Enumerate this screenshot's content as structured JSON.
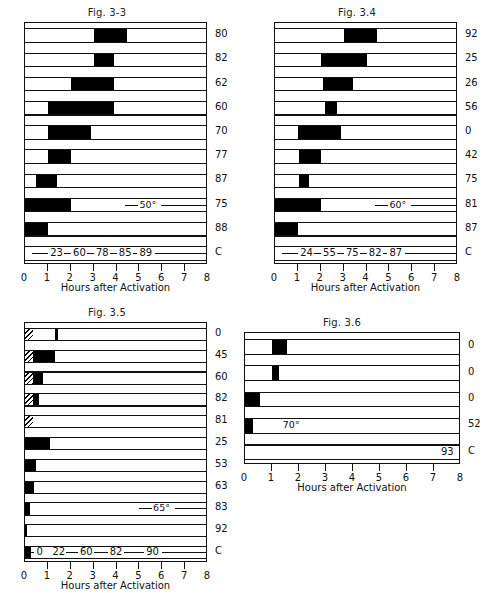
{
  "page": {
    "background": "#ffffff",
    "ink": "#000000"
  },
  "axis": {
    "title": "Hours after Activation",
    "ticks": [
      "0",
      "1",
      "2",
      "3",
      "4",
      "5",
      "6",
      "7",
      "8"
    ],
    "min": 0,
    "max": 8,
    "unit": "hours"
  },
  "chart_data": [
    {
      "type": "bar",
      "id": "fig-3-3",
      "title": "Fig. 3-3",
      "xlabel": "Hours after Activation",
      "ylabel": "",
      "xlim": [
        0,
        8
      ],
      "grid": false,
      "legend": "none",
      "annotation": "50°",
      "row_labels": [
        "80",
        "82",
        "62",
        "60",
        "70",
        "77",
        "87",
        "75",
        "88",
        "C"
      ],
      "bars": [
        {
          "label": "80",
          "segments": [
            {
              "start": 3.0,
              "end": 4.45,
              "fill": "solid"
            }
          ]
        },
        {
          "label": "82",
          "segments": [
            {
              "start": 3.0,
              "end": 3.9,
              "fill": "solid"
            }
          ]
        },
        {
          "label": "62",
          "segments": [
            {
              "start": 2.0,
              "end": 3.9,
              "fill": "solid"
            }
          ]
        },
        {
          "label": "60",
          "segments": [
            {
              "start": 1.0,
              "end": 3.9,
              "fill": "solid"
            }
          ]
        },
        {
          "label": "70",
          "segments": [
            {
              "start": 1.0,
              "end": 2.9,
              "fill": "solid"
            }
          ]
        },
        {
          "label": "77",
          "segments": [
            {
              "start": 1.0,
              "end": 2.0,
              "fill": "solid"
            }
          ]
        },
        {
          "label": "87",
          "segments": [
            {
              "start": 0.5,
              "end": 1.4,
              "fill": "solid"
            }
          ]
        },
        {
          "label": "75",
          "segments": [
            {
              "start": 0.0,
              "end": 2.0,
              "fill": "solid"
            }
          ]
        },
        {
          "label": "88",
          "segments": [
            {
              "start": 0.0,
              "end": 1.0,
              "fill": "solid"
            }
          ]
        },
        {
          "label": "C",
          "segments": []
        }
      ],
      "c_row": {
        "label": "C",
        "values": [
          "23",
          "60",
          "78",
          "85",
          "89"
        ],
        "positions": [
          1.1,
          2.1,
          3.1,
          4.1,
          5.0
        ]
      }
    },
    {
      "type": "bar",
      "id": "fig-3-4",
      "title": "Fig. 3.4",
      "xlabel": "Hours after Activation",
      "ylabel": "",
      "xlim": [
        0,
        8
      ],
      "grid": false,
      "legend": "none",
      "annotation": "60°",
      "row_labels": [
        "92",
        "25",
        "26",
        "56",
        "0",
        "42",
        "75",
        "81",
        "87",
        "C"
      ],
      "bars": [
        {
          "label": "92",
          "segments": [
            {
              "start": 3.0,
              "end": 4.45,
              "fill": "solid"
            }
          ]
        },
        {
          "label": "25",
          "segments": [
            {
              "start": 2.0,
              "end": 4.0,
              "fill": "solid"
            }
          ]
        },
        {
          "label": "26",
          "segments": [
            {
              "start": 2.1,
              "end": 3.4,
              "fill": "solid"
            }
          ]
        },
        {
          "label": "56",
          "segments": [
            {
              "start": 2.2,
              "end": 2.7,
              "fill": "solid"
            }
          ]
        },
        {
          "label": "0",
          "segments": [
            {
              "start": 1.0,
              "end": 2.9,
              "fill": "solid"
            }
          ]
        },
        {
          "label": "42",
          "segments": [
            {
              "start": 1.05,
              "end": 2.0,
              "fill": "solid"
            }
          ]
        },
        {
          "label": "75",
          "segments": [
            {
              "start": 1.05,
              "end": 1.5,
              "fill": "solid"
            }
          ]
        },
        {
          "label": "81",
          "segments": [
            {
              "start": 0.0,
              "end": 2.0,
              "fill": "solid"
            }
          ]
        },
        {
          "label": "87",
          "segments": [
            {
              "start": 0.0,
              "end": 1.0,
              "fill": "solid"
            }
          ]
        },
        {
          "label": "C",
          "segments": []
        }
      ],
      "c_row": {
        "label": "C",
        "values": [
          "24",
          "55",
          "75",
          "82",
          "87"
        ],
        "positions": [
          1.1,
          2.1,
          3.1,
          4.1,
          5.0
        ]
      }
    },
    {
      "type": "bar",
      "id": "fig-3-5",
      "title": "Fig. 3.5",
      "xlabel": "Hours after Activation",
      "ylabel": "",
      "xlim": [
        0,
        8
      ],
      "grid": false,
      "legend": "none",
      "annotation": "65°",
      "row_labels": [
        "0",
        "45",
        "60",
        "82",
        "81",
        "25",
        "53",
        "63",
        "83",
        "92",
        "C"
      ],
      "bars": [
        {
          "label": "0",
          "segments": [
            {
              "start": 0.0,
              "end": 0.35,
              "fill": "hatch"
            },
            {
              "start": 1.3,
              "end": 1.45,
              "fill": "solid"
            }
          ]
        },
        {
          "label": "45",
          "segments": [
            {
              "start": 0.0,
              "end": 0.35,
              "fill": "hatch"
            },
            {
              "start": 0.35,
              "end": 1.3,
              "fill": "solid"
            }
          ]
        },
        {
          "label": "60",
          "segments": [
            {
              "start": 0.0,
              "end": 0.35,
              "fill": "hatch"
            },
            {
              "start": 0.35,
              "end": 0.8,
              "fill": "solid"
            }
          ]
        },
        {
          "label": "82",
          "segments": [
            {
              "start": 0.0,
              "end": 0.35,
              "fill": "hatch"
            },
            {
              "start": 0.35,
              "end": 0.6,
              "fill": "solid"
            }
          ]
        },
        {
          "label": "81",
          "segments": [
            {
              "start": 0.0,
              "end": 0.35,
              "fill": "hatch"
            }
          ]
        },
        {
          "label": "25",
          "segments": [
            {
              "start": 0.0,
              "end": 1.1,
              "fill": "solid"
            }
          ]
        },
        {
          "label": "53",
          "segments": [
            {
              "start": 0.0,
              "end": 0.5,
              "fill": "solid"
            }
          ]
        },
        {
          "label": "63",
          "segments": [
            {
              "start": 0.0,
              "end": 0.4,
              "fill": "solid"
            }
          ]
        },
        {
          "label": "83",
          "segments": [
            {
              "start": 0.0,
              "end": 0.2,
              "fill": "solid"
            }
          ]
        },
        {
          "label": "92",
          "segments": [
            {
              "start": 0.0,
              "end": 0.1,
              "fill": "solid"
            }
          ]
        },
        {
          "label": "C",
          "segments": [
            {
              "start": 0.0,
              "end": 0.25,
              "fill": "solid"
            }
          ]
        }
      ],
      "c_row": {
        "label": "C",
        "values": [
          "0",
          "22",
          "60",
          "82",
          "90"
        ],
        "positions": [
          0.5,
          1.2,
          2.4,
          3.7,
          5.3
        ]
      }
    },
    {
      "type": "bar",
      "id": "fig-3-6",
      "title": "Fig. 3.6",
      "xlabel": "Hours after Activation",
      "ylabel": "",
      "xlim": [
        0,
        8
      ],
      "grid": false,
      "legend": "none",
      "annotation": "70°",
      "row_labels": [
        "0",
        "0",
        "0",
        "52",
        "C"
      ],
      "bars": [
        {
          "label": "0",
          "segments": [
            {
              "start": 1.0,
              "end": 1.55,
              "fill": "solid"
            }
          ]
        },
        {
          "label": "0",
          "segments": [
            {
              "start": 1.0,
              "end": 1.25,
              "fill": "solid"
            }
          ]
        },
        {
          "label": "0",
          "segments": [
            {
              "start": 0.0,
              "end": 0.55,
              "fill": "solid"
            }
          ]
        },
        {
          "label": "52",
          "segments": [
            {
              "start": 0.0,
              "end": 0.3,
              "fill": "solid"
            }
          ]
        },
        {
          "label": "C",
          "segments": []
        }
      ],
      "c_row": {
        "label": "C",
        "values": [
          "93"
        ],
        "positions": [
          6.9
        ]
      }
    }
  ]
}
